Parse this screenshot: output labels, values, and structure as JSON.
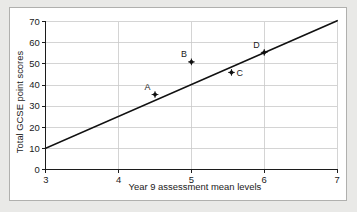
{
  "chart_data": {
    "type": "scatter",
    "title": "",
    "xlabel": "Year 9 assessment mean levels",
    "ylabel": "Total GCSE point scores",
    "xlim": [
      3,
      7
    ],
    "ylim": [
      0,
      70
    ],
    "x_ticks": [
      "3",
      "4",
      "5",
      "6",
      "7"
    ],
    "x_tick_values": [
      3,
      4,
      5,
      6,
      7
    ],
    "y_ticks": [
      "0",
      "10",
      "20",
      "30",
      "40",
      "50",
      "60",
      "70"
    ],
    "y_tick_values": [
      0,
      10,
      20,
      30,
      40,
      50,
      60,
      70
    ],
    "grid": "horizontal-and-vertical",
    "legend": "none",
    "points": [
      {
        "label": "A",
        "x": 4.5,
        "y": 35.5,
        "label_pos": "left-above"
      },
      {
        "label": "B",
        "x": 5.0,
        "y": 51.0,
        "label_pos": "left-above"
      },
      {
        "label": "C",
        "x": 5.55,
        "y": 46.0,
        "label_pos": "right"
      },
      {
        "label": "D",
        "x": 6.0,
        "y": 55.5,
        "label_pos": "left-above"
      }
    ],
    "series": [
      {
        "name": "line of best fit",
        "type": "line",
        "x": [
          3,
          7
        ],
        "values": [
          10,
          70.5
        ]
      }
    ],
    "colors": {
      "marker": "#111111",
      "line": "#111111",
      "grid": "#c9c9c9",
      "axis": "#1a1a1a",
      "panel_background": "#ffffff",
      "page_background": "#e9e9e7"
    }
  }
}
